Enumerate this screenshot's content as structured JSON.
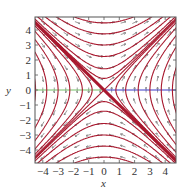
{
  "chart_data": {
    "type": "phase-portrait",
    "title": "",
    "xlabel": "x",
    "ylabel": "y",
    "xlim": [
      -4.55,
      4.7
    ],
    "ylim": [
      -4.85,
      4.85
    ],
    "xticks": [
      -4,
      -3,
      -2,
      -1,
      0,
      1,
      2,
      3,
      4
    ],
    "yticks": [
      -4,
      -3,
      -2,
      -1,
      0,
      1,
      2,
      3,
      4
    ],
    "system": {
      "dx_dt": "y",
      "dy_dt": "x"
    },
    "equilibrium": {
      "x": 0,
      "y": 0,
      "type": "saddle"
    },
    "separatrix": {
      "equation": "y = -x",
      "style": "bold"
    },
    "nullclines": [
      {
        "segment": "y = 0, x < 0",
        "color": "#74c068"
      },
      {
        "segment": "y = 0, x > 0",
        "color": "#3a3ac8"
      }
    ],
    "trajectory_levels_x2_minus_y2": [
      -20,
      -14,
      -9,
      -5,
      -2,
      -0.6,
      0.6,
      2,
      5,
      9,
      14,
      20
    ],
    "colors": {
      "trajectory": "#a8182e",
      "arrow": "#555555",
      "frame": "#555555",
      "green_line": "#74c068",
      "blue_line": "#3a3ac8"
    }
  },
  "axes": {
    "x_label": "x",
    "y_label": "y",
    "x_tick_labels": [
      "−4",
      "−3",
      "−2",
      "−1",
      "0",
      "1",
      "2",
      "3",
      "4"
    ],
    "y_tick_labels": [
      "4",
      "3",
      "2",
      "1",
      "0",
      "−1",
      "−2",
      "−3",
      "−4"
    ]
  }
}
